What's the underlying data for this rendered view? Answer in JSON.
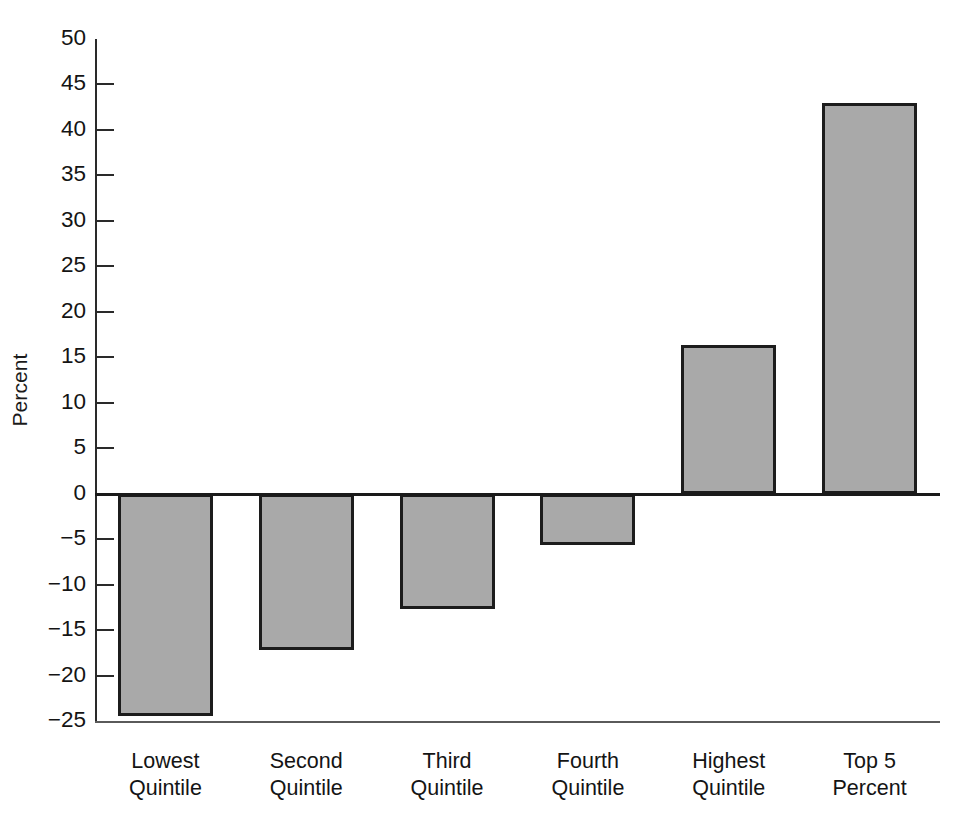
{
  "chart_data": {
    "type": "bar",
    "title": "",
    "subtitle": "",
    "xlabel": "",
    "ylabel": "Percent",
    "ylim": [
      -25,
      50
    ],
    "ytick_step": 5,
    "grid": false,
    "legend": null,
    "bar_fill_color": "#a9a9a9",
    "bar_edge_color": "#1c1c1c",
    "axis_color": "#2a2a2a",
    "categories": [
      "Lowest Quintile",
      "Second Quintile",
      "Third Quintile",
      "Fourth Quintile",
      "Highest Quintile",
      "Top 5 Percent"
    ],
    "category_lines": [
      [
        "Lowest",
        "Quintile"
      ],
      [
        "Second",
        "Quintile"
      ],
      [
        "Third",
        "Quintile"
      ],
      [
        "Fourth",
        "Quintile"
      ],
      [
        "Highest",
        "Quintile"
      ],
      [
        "Top 5",
        "Percent"
      ]
    ],
    "values": [
      -24.5,
      -17.2,
      -12.7,
      -5.7,
      16.3,
      43.0
    ],
    "yticks": [
      50,
      45,
      40,
      35,
      30,
      25,
      20,
      15,
      10,
      5,
      0,
      -5,
      -10,
      -15,
      -20,
      -25
    ],
    "ytick_labels": [
      "50",
      "45",
      "40",
      "35",
      "30",
      "25",
      "20",
      "15",
      "10",
      "5",
      "0",
      "−5",
      "−10",
      "−15",
      "−20",
      "−25"
    ]
  }
}
